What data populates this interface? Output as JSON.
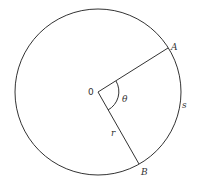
{
  "diagram": {
    "center": {
      "label": "0",
      "x": 98,
      "y": 92
    },
    "radius": 83,
    "points": [
      {
        "label": "A",
        "x": 168,
        "y": 48
      },
      {
        "label": "B",
        "x": 139,
        "y": 164
      }
    ],
    "labels": {
      "center": "0",
      "A": "A",
      "B": "B",
      "theta": "θ",
      "radius": "r",
      "arc": "s"
    },
    "colors": {
      "stroke": "#333333",
      "background": "#ffffff"
    }
  }
}
